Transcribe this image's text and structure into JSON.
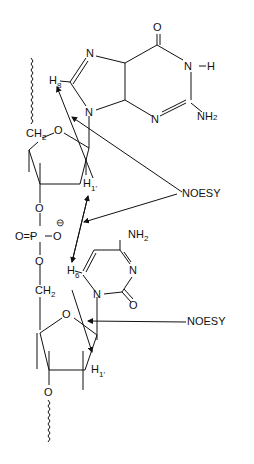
{
  "diagram": {
    "guanine": {
      "O": "O",
      "N7": "N",
      "N1H": "N",
      "H1": "H",
      "N9": "N",
      "N3": "N",
      "NH2": "NH",
      "NH2_sub": "2",
      "H8": "H",
      "H8_sub": "8"
    },
    "sugar1": {
      "CH2": "CH",
      "CH2_sub": "2",
      "O": "O",
      "H1p": "H",
      "H1p_sub": "1'"
    },
    "phosphate": {
      "O_top": "O",
      "O_dbl": "O=P",
      "O_neg": "O",
      "charge": "⊖",
      "O_bottom": "O",
      "CH2": "CH",
      "CH2_sub": "2"
    },
    "cytosine": {
      "NH2": "NH",
      "NH2_sub": "2",
      "N3": "N",
      "N1": "N",
      "O": "O",
      "H6": "H",
      "H6_sub": "6"
    },
    "sugar2": {
      "O": "O",
      "H1p": "H",
      "H1p_sub": "1'",
      "O3": "O"
    },
    "annotations": [
      {
        "label": "NOESY"
      },
      {
        "label": "NOESY"
      }
    ]
  }
}
